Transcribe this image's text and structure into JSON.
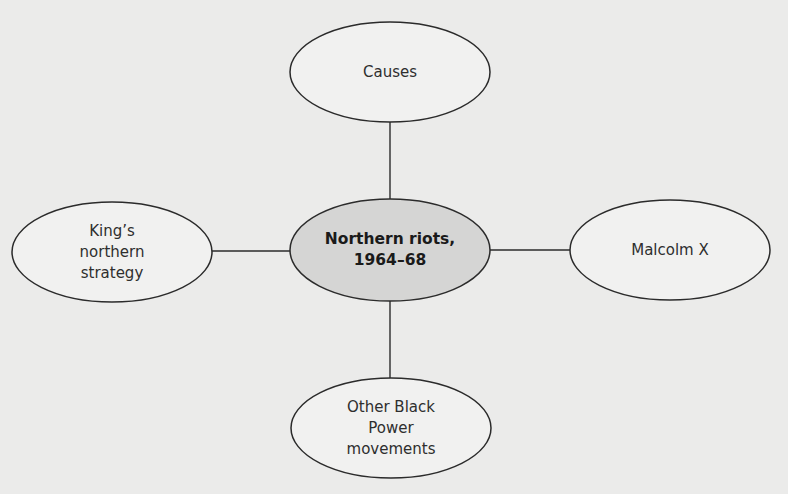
{
  "diagram": {
    "type": "spider-diagram",
    "background": "#ebebea",
    "stroke_color": "#2b2b2b",
    "center_fill": "#d5d5d4",
    "outer_fill": "#f1f1f0",
    "center": {
      "id": "center",
      "label": "Northern riots,\n1964–68",
      "cx": 390,
      "cy": 250,
      "rx": 100,
      "ry": 51
    },
    "nodes": [
      {
        "id": "causes",
        "label": "Causes",
        "cx": 390,
        "cy": 72,
        "rx": 100,
        "ry": 50
      },
      {
        "id": "malcolm-x",
        "label": "Malcolm X",
        "cx": 670,
        "cy": 250,
        "rx": 100,
        "ry": 50
      },
      {
        "id": "other-black-power",
        "label": "Other Black\nPower\nmovements",
        "cx": 391,
        "cy": 428,
        "rx": 100,
        "ry": 50
      },
      {
        "id": "kings-northern-strategy",
        "label": "King’s\nnorthern\nstrategy",
        "cx": 112,
        "cy": 252,
        "rx": 100,
        "ry": 50
      }
    ]
  }
}
